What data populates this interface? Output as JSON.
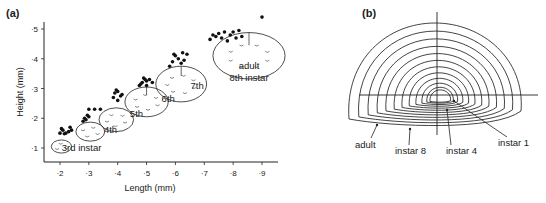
{
  "chart_data": [
    {
      "type": "scatter",
      "panel_label": "(a)",
      "xlabel": "Length (mm)",
      "ylabel": "Height (mm)",
      "xlim": [
        1.8,
        9.8
      ],
      "ylim": [
        0.55,
        5.2
      ],
      "x_ticks": [
        2,
        3,
        4,
        5,
        6,
        7,
        8,
        9
      ],
      "x_tick_labels": [
        "·2",
        "·3",
        "·4",
        "·5",
        "·6",
        "·7",
        "·8",
        "·9"
      ],
      "y_ticks": [
        1,
        2,
        3,
        4,
        5
      ],
      "y_tick_labels": [
        "·1",
        "·2",
        "·3",
        "·4",
        "·5"
      ],
      "grid": false,
      "series": [
        {
          "name": "3rd instar",
          "points": [
            [
              2.0,
              1.5
            ],
            [
              2.1,
              1.6
            ],
            [
              2.15,
              1.48
            ],
            [
              2.05,
              1.65
            ],
            [
              2.3,
              1.55
            ],
            [
              2.4,
              1.6
            ],
            [
              2.35,
              1.7
            ],
            [
              2.2,
              1.5
            ]
          ]
        },
        {
          "name": "4th instar",
          "points": [
            [
              2.8,
              1.9
            ],
            [
              2.85,
              2.0
            ],
            [
              2.95,
              2.1
            ],
            [
              3.0,
              2.3
            ],
            [
              3.2,
              2.3
            ],
            [
              3.4,
              2.3
            ],
            [
              2.9,
              1.95
            ],
            [
              3.0,
              2.05
            ]
          ]
        },
        {
          "name": "5th instar",
          "points": [
            [
              3.85,
              2.7
            ],
            [
              3.9,
              2.85
            ],
            [
              4.0,
              2.9
            ],
            [
              4.1,
              2.75
            ],
            [
              4.0,
              2.6
            ],
            [
              3.95,
              2.95
            ],
            [
              4.15,
              2.8
            ]
          ]
        },
        {
          "name": "6th instar",
          "points": [
            [
              4.75,
              3.1
            ],
            [
              4.85,
              3.2
            ],
            [
              5.0,
              3.25
            ],
            [
              5.1,
              3.3
            ],
            [
              4.9,
              3.35
            ],
            [
              5.2,
              3.2
            ],
            [
              4.8,
              3.15
            ],
            [
              5.0,
              3.1
            ],
            [
              4.95,
              3.3
            ]
          ]
        },
        {
          "name": "7th instar",
          "points": [
            [
              5.8,
              3.75
            ],
            [
              5.9,
              3.9
            ],
            [
              6.0,
              4.1
            ],
            [
              6.1,
              4.0
            ],
            [
              6.25,
              4.2
            ],
            [
              6.4,
              4.15
            ],
            [
              6.3,
              3.95
            ],
            [
              5.95,
              4.15
            ],
            [
              6.2,
              3.85
            ]
          ]
        },
        {
          "name": "adult 8th instar",
          "points": [
            [
              7.2,
              4.65
            ],
            [
              7.4,
              4.75
            ],
            [
              7.5,
              4.85
            ],
            [
              7.7,
              4.9
            ],
            [
              7.9,
              4.8
            ],
            [
              8.0,
              4.9
            ],
            [
              8.2,
              4.95
            ],
            [
              7.6,
              4.7
            ],
            [
              7.8,
              4.6
            ],
            [
              8.1,
              4.7
            ],
            [
              8.3,
              4.75
            ],
            [
              7.3,
              4.8
            ],
            [
              9.0,
              5.4
            ]
          ]
        }
      ],
      "annotations": [
        {
          "text": "3rd instar",
          "x": 2.75,
          "y": 0.9
        },
        {
          "text": "4th",
          "x": 3.75,
          "y": 1.5
        },
        {
          "text": "5th",
          "x": 4.65,
          "y": 2.05
        },
        {
          "text": "6th",
          "x": 5.75,
          "y": 2.55
        },
        {
          "text": "7th",
          "x": 6.75,
          "y": 3.0
        },
        {
          "text": "adult",
          "x": 8.55,
          "y": 3.65
        },
        {
          "text": "8th instar",
          "x": 8.55,
          "y": 3.25
        }
      ],
      "scale_drawings": [
        {
          "stage": "3rd",
          "cx": 2.05,
          "cy": 1.05,
          "rx": 0.35,
          "ry": 0.22
        },
        {
          "stage": "4th",
          "cx": 3.05,
          "cy": 1.55,
          "rx": 0.5,
          "ry": 0.32
        },
        {
          "stage": "5th",
          "cx": 3.95,
          "cy": 1.95,
          "rx": 0.6,
          "ry": 0.4
        },
        {
          "stage": "6th",
          "cx": 5.0,
          "cy": 2.55,
          "rx": 0.75,
          "ry": 0.5
        },
        {
          "stage": "7th",
          "cx": 6.2,
          "cy": 3.15,
          "rx": 0.88,
          "ry": 0.6
        },
        {
          "stage": "adult",
          "cx": 8.55,
          "cy": 4.1,
          "rx": 1.25,
          "ry": 0.78
        }
      ]
    },
    {
      "type": "diagram",
      "panel_label": "(b)",
      "description": "Concentric growth outlines of carapace, from instar 1 (innermost) to adult (outermost)",
      "contour_count": 12,
      "labels": [
        "adult",
        "instar 8",
        "instar 4",
        "instar 1"
      ]
    }
  ]
}
